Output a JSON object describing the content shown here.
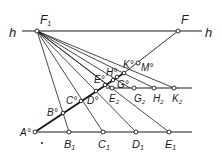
{
  "diagram": {
    "type": "descriptive-geometry-construction",
    "colors": {
      "line": "#1a1a1a",
      "background": "#ffffff"
    },
    "labels": {
      "h_left": "h",
      "h_right": "h",
      "F1": "F",
      "F1_sub": "1",
      "F": "F",
      "A": "A°",
      "B": "B°",
      "C": "C°",
      "D": "D°",
      "E": "E°",
      "G": "G°",
      "H": "H°",
      "K": "K°",
      "M": "M°",
      "B1": "B",
      "B1_sub": "1",
      "C1": "C",
      "C1_sub": "1",
      "D1": "D",
      "D1_sub": "1",
      "E1": "E",
      "E1_sub": "1",
      "E2": "E",
      "E2_sub": "2",
      "G2": "G",
      "G2_sub": "2",
      "H2": "H",
      "H2_sub": "2",
      "K2": "K",
      "K2_sub": "2",
      "dot": "·"
    }
  }
}
